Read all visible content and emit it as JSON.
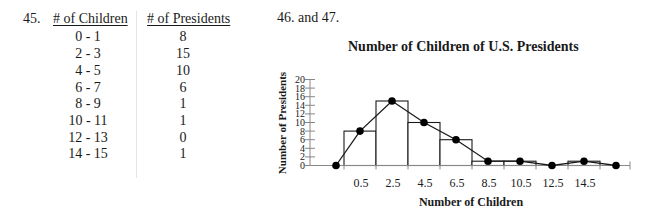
{
  "table": {
    "question_number": "45.",
    "headers": [
      "# of Children",
      "# of Presidents"
    ],
    "rows": [
      {
        "children": "0 -  1",
        "presidents": "8"
      },
      {
        "children": "2 -  3",
        "presidents": "15"
      },
      {
        "children": "4 -  5",
        "presidents": "10"
      },
      {
        "children": "6 -  7",
        "presidents": "6"
      },
      {
        "children": "8 -  9",
        "presidents": "1"
      },
      {
        "children": "10 - 11",
        "presidents": "1"
      },
      {
        "children": "12 - 13",
        "presidents": "0"
      },
      {
        "children": "14 - 15",
        "presidents": "1"
      }
    ]
  },
  "chart_section": {
    "question_label": "46. and 47."
  },
  "chart_data": {
    "type": "bar",
    "subtype": "histogram with frequency polygon",
    "title": "Number of Children of U.S. Presidents",
    "xlabel": "Number of Children",
    "ylabel": "Number of Presidents",
    "categories": [
      "0-1",
      "2-3",
      "4-5",
      "6-7",
      "8-9",
      "10-11",
      "12-13",
      "14-15"
    ],
    "x_tick_labels": [
      "0.5",
      "2.5",
      "4.5",
      "6.5",
      "8.5",
      "10.5",
      "12.5",
      "14.5"
    ],
    "values": [
      8,
      15,
      10,
      6,
      1,
      1,
      0,
      1
    ],
    "frequency_polygon": {
      "x": [
        -1,
        0.5,
        2.5,
        4.5,
        6.5,
        8.5,
        10.5,
        12.5,
        14.5,
        16.5
      ],
      "y": [
        0,
        8,
        15,
        10,
        6,
        1,
        1,
        0,
        1,
        0
      ]
    },
    "y_ticks": [
      0,
      2,
      4,
      6,
      8,
      10,
      12,
      14,
      16,
      18,
      20
    ],
    "ylim": [
      0,
      20
    ],
    "grid": false,
    "legend": null,
    "colors": {
      "bar_fill": "#ffffff",
      "stroke": "#1a1a1a",
      "point": "#000000",
      "axis": "#888888"
    }
  }
}
